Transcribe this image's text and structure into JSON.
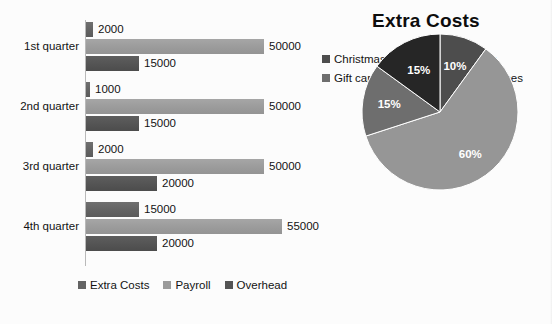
{
  "chart_data": [
    {
      "type": "bar",
      "title": "",
      "orientation": "horizontal",
      "categories": [
        "1st quarter",
        "2nd quarter",
        "3rd quarter",
        "4th quarter"
      ],
      "series": [
        {
          "name": "Extra Costs",
          "values": [
            2000,
            1000,
            2000,
            15000
          ],
          "color": "#636363"
        },
        {
          "name": "Payroll",
          "values": [
            50000,
            50000,
            50000,
            55000
          ],
          "color": "#9b9b9b"
        },
        {
          "name": "Overhead",
          "values": [
            15000,
            15000,
            20000,
            20000
          ],
          "color": "#545454"
        }
      ],
      "data_labels": [
        [
          "2000",
          "50000",
          "15000"
        ],
        [
          "1000",
          "50000",
          "15000"
        ],
        [
          "2000",
          "50000",
          "20000"
        ],
        [
          "15000",
          "55000",
          "20000"
        ]
      ],
      "xlabel": "",
      "ylabel": "",
      "xlim": [
        0,
        55000
      ],
      "grid": false,
      "legend_position": "bottom"
    },
    {
      "type": "pie",
      "title": "Extra Costs",
      "labels": [
        "Christmas party",
        "Bonuses",
        "Gift cards",
        "Team lunches"
      ],
      "values": [
        10,
        60,
        15,
        15
      ],
      "value_labels": [
        "10%",
        "60%",
        "15%",
        "15%"
      ],
      "colors": [
        "#4d4d4d",
        "#969696",
        "#6e6e6e",
        "#262626"
      ],
      "legend_position": "top",
      "start_angle_deg": 0,
      "direction": "clockwise"
    }
  ],
  "bar_chart": {
    "legend": [
      {
        "label": "Extra Costs",
        "color": "#636363"
      },
      {
        "label": "Payroll",
        "color": "#9b9b9b"
      },
      {
        "label": "Overhead",
        "color": "#545454"
      }
    ]
  },
  "pie_chart": {
    "title": "Extra Costs",
    "legend": [
      {
        "label": "Christmas party",
        "color": "#4d4d4d"
      },
      {
        "label": "Bonuses",
        "color": "#969696"
      },
      {
        "label": "Gift cards",
        "color": "#6e6e6e"
      },
      {
        "label": "Team lunches",
        "color": "#262626"
      }
    ]
  }
}
